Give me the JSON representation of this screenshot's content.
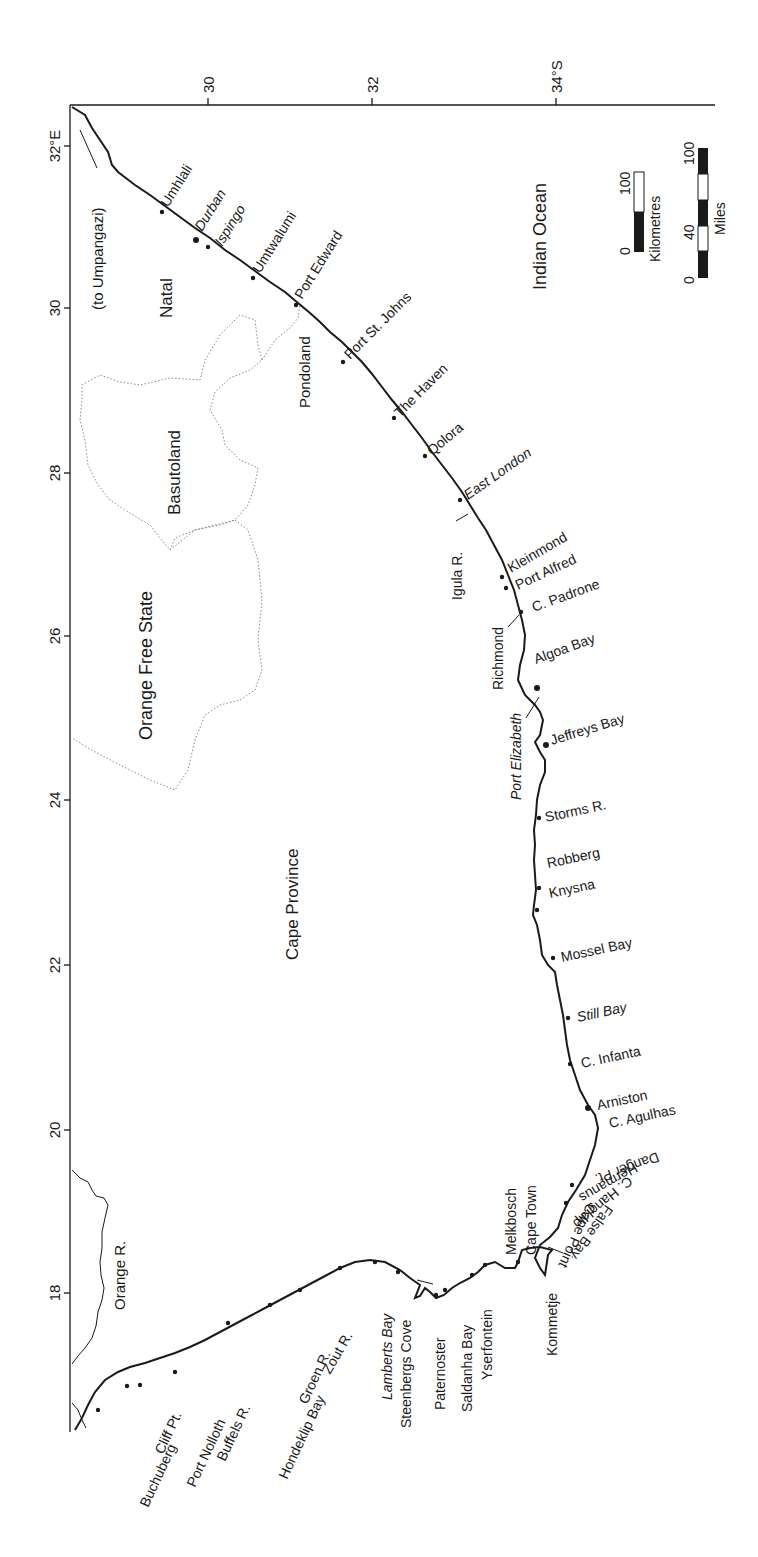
{
  "map": {
    "axes": {
      "top_latitude_ticks": [
        {
          "label": "30",
          "x": 208
        },
        {
          "label": "32",
          "x": 372
        },
        {
          "label": "34°S",
          "x": 556
        }
      ],
      "left_longitude_ticks": [
        {
          "label": "32°E",
          "y": 146
        },
        {
          "label": "30",
          "y": 308
        },
        {
          "label": "28",
          "y": 473
        },
        {
          "label": "26",
          "y": 636
        },
        {
          "label": "24",
          "y": 800
        },
        {
          "label": "22",
          "y": 965
        },
        {
          "label": "20",
          "y": 1130
        },
        {
          "label": "18",
          "y": 1293
        }
      ]
    },
    "regions": {
      "natal": "Natal",
      "basutoland": "Basutoland",
      "orange_free_state": "Orange Free State",
      "cape_province": "Cape Province",
      "pondoland": "Pondoland",
      "indian_ocean": "Indian Ocean",
      "orange_river": "Orange R.",
      "to_umpangazi": "(to Umpangazi)"
    },
    "scale_bars": {
      "km": {
        "title": "Kilometres",
        "min": "0",
        "max": "100"
      },
      "miles": {
        "title": "Miles",
        "min": "0",
        "mid": "40",
        "max": "100"
      }
    },
    "east_coast_places": [
      {
        "name": "Umhlali",
        "italic": false
      },
      {
        "name": "Durban",
        "italic": true
      },
      {
        "name": "Ispingo",
        "italic": true
      },
      {
        "name": "Umtwalumi",
        "italic": false
      },
      {
        "name": "Port Edward",
        "italic": false
      },
      {
        "name": "Port St. Johns",
        "italic": false
      },
      {
        "name": "The Haven",
        "italic": false
      },
      {
        "name": "Qolora",
        "italic": false
      },
      {
        "name": "East London",
        "italic": true
      },
      {
        "name": "Igula R.",
        "italic": false
      },
      {
        "name": "Kleinmond",
        "italic": false
      },
      {
        "name": "Port Alfred",
        "italic": false
      },
      {
        "name": "C. Padrone",
        "italic": false
      },
      {
        "name": "Richmond",
        "italic": false
      },
      {
        "name": "Algoa Bay",
        "italic": false
      },
      {
        "name": "Port Elizabeth",
        "italic": true
      },
      {
        "name": "Jeffreys Bay",
        "italic": false
      }
    ],
    "south_coast_places": [
      {
        "name": "Storms R.",
        "italic": false
      },
      {
        "name": "Robberg",
        "italic": false
      },
      {
        "name": "Knysna",
        "italic": false
      },
      {
        "name": "Mossel Bay",
        "italic": false
      },
      {
        "name": "Still Bay",
        "italic": true
      },
      {
        "name": "C. Infanta",
        "italic": false
      },
      {
        "name": "Arniston",
        "italic": false
      },
      {
        "name": "C. Agulhas",
        "italic": false
      },
      {
        "name": "Danger Pt.",
        "italic": false
      },
      {
        "name": "Hermanus",
        "italic": false
      },
      {
        "name": "C. Hangklip",
        "italic": false
      },
      {
        "name": "False Bay",
        "italic": false
      },
      {
        "name": "Cape Point",
        "italic": false
      },
      {
        "name": "Kommetje",
        "italic": false
      }
    ],
    "west_coast_places": [
      {
        "name": "Cape Town",
        "italic": false
      },
      {
        "name": "Melkbosch",
        "italic": false
      },
      {
        "name": "Yserfontein",
        "italic": false
      },
      {
        "name": "Saldanha Bay",
        "italic": false
      },
      {
        "name": "Paternoster",
        "italic": false
      },
      {
        "name": "Steenbergs Cove",
        "italic": false
      },
      {
        "name": "Lamberts Bay",
        "italic": true
      },
      {
        "name": "Zout R.",
        "italic": false
      },
      {
        "name": "Groen R.",
        "italic": false
      },
      {
        "name": "Hondeklip Bay",
        "italic": false
      },
      {
        "name": "Buffels R.",
        "italic": false
      },
      {
        "name": "Port Nolloth",
        "italic": false
      },
      {
        "name": "Cliff Pt.",
        "italic": false
      },
      {
        "name": "Buchuberg",
        "italic": false
      }
    ],
    "colors": {
      "ink": "#1a1a1a",
      "border_dotted": "#888888",
      "background": "#ffffff"
    }
  }
}
